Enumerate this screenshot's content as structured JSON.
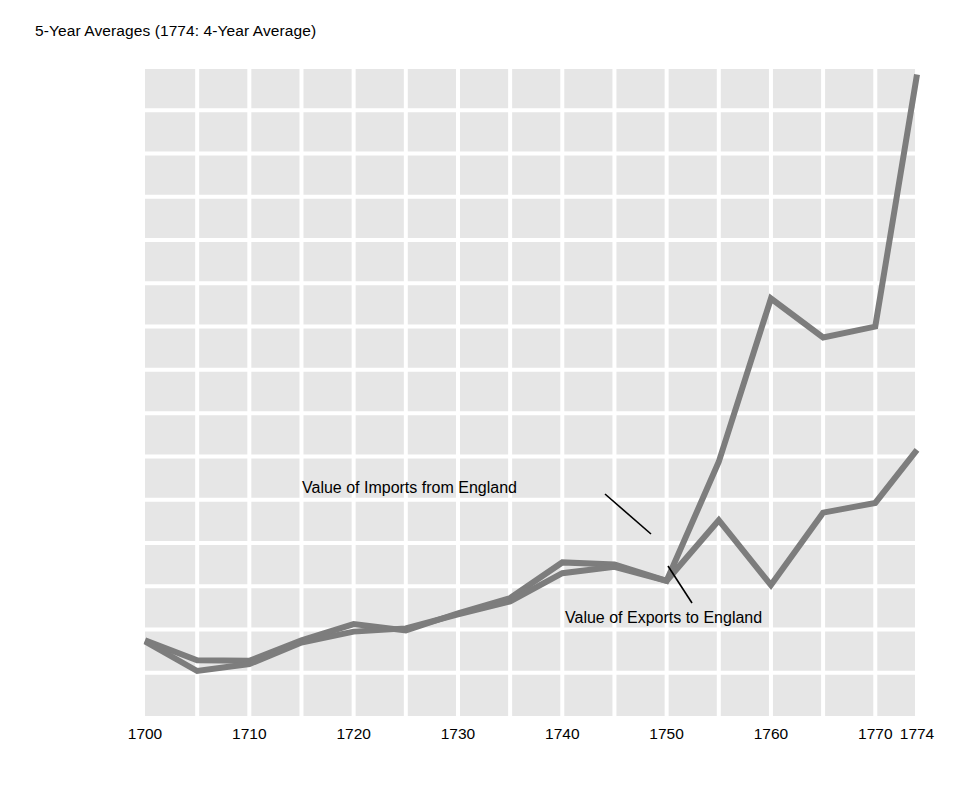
{
  "chart_data": {
    "type": "line",
    "title": "5-Year Averages (1774: 4-Year Average)",
    "xlabel": "",
    "ylabel": "",
    "currency_symbol": "£",
    "xlim": [
      1700,
      1774
    ],
    "ylim": [
      0,
      3000000
    ],
    "grid": true,
    "legend_position": "inline-annotations",
    "x": [
      1700,
      1705,
      1710,
      1715,
      1720,
      1725,
      1730,
      1735,
      1740,
      1745,
      1750,
      1755,
      1760,
      1765,
      1770,
      1774
    ],
    "categories": [
      "1700",
      "1705",
      "1710",
      "1715",
      "1720",
      "1725",
      "1730",
      "1735",
      "1740",
      "1745",
      "1750",
      "1755",
      "1760",
      "1765",
      "1770",
      "1774"
    ],
    "xticks": [
      {
        "label": "1700",
        "value": 1700
      },
      {
        "label": "1710",
        "value": 1710
      },
      {
        "label": "1720",
        "value": 1720
      },
      {
        "label": "1730",
        "value": 1730
      },
      {
        "label": "1740",
        "value": 1740
      },
      {
        "label": "1750",
        "value": 1750
      },
      {
        "label": "1760",
        "value": 1760
      },
      {
        "label": "1770",
        "value": 1770
      },
      {
        "label": "1774",
        "value": 1774
      }
    ],
    "yticks": [
      {
        "label": "£ 3,000,000",
        "value": 3000000
      },
      {
        "label": "2,800,000",
        "value": 2800000
      },
      {
        "label": "2,600,000",
        "value": 2600000
      },
      {
        "label": "2,400,000",
        "value": 2400000
      },
      {
        "label": "2,200,000",
        "value": 2200000
      },
      {
        "label": "2,000,000",
        "value": 2000000
      },
      {
        "label": "1,800,000",
        "value": 1800000
      },
      {
        "label": "1,600,000",
        "value": 1600000
      },
      {
        "label": "1,400,000",
        "value": 1400000
      },
      {
        "label": "1,200,000",
        "value": 1200000
      },
      {
        "label": "1,000,000",
        "value": 1000000
      },
      {
        "label": "800,000",
        "value": 800000
      },
      {
        "label": "600,000",
        "value": 600000
      },
      {
        "label": "400,000",
        "value": 400000
      },
      {
        "label": "200,000",
        "value": 200000
      },
      {
        "label": "0",
        "value": 0
      }
    ],
    "series": [
      {
        "name": "Value of Imports from England",
        "color": "#7d7d7d",
        "values": [
          350000,
          258000,
          255000,
          350000,
          425000,
          395000,
          475000,
          545000,
          710000,
          700000,
          625000,
          1175000,
          1930000,
          1750000,
          1800000,
          2965000
        ]
      },
      {
        "name": "Value of Exports to England",
        "color": "#7d7d7d",
        "values": [
          345000,
          208000,
          240000,
          340000,
          390000,
          405000,
          470000,
          530000,
          660000,
          690000,
          625000,
          905000,
          605000,
          940000,
          985000,
          1230000
        ]
      }
    ],
    "annotations": [
      {
        "id": "imports-annotation",
        "text": "Value of Imports from England",
        "label_x": 302,
        "label_y": 480,
        "leader": {
          "x1": 605,
          "y1": 494,
          "x2": 651,
          "y2": 534
        }
      },
      {
        "id": "exports-annotation",
        "text": "Value of Exports to England",
        "label_x": 565,
        "label_y": 610,
        "leader": {
          "x1": 692,
          "y1": 603,
          "x2": 668,
          "y2": 566
        }
      }
    ],
    "colors": {
      "plot_background": "#e6e6e6",
      "gridline": "#ffffff",
      "line": "#7d7d7d",
      "text": "#000000",
      "page_background": "#ffffff"
    }
  }
}
